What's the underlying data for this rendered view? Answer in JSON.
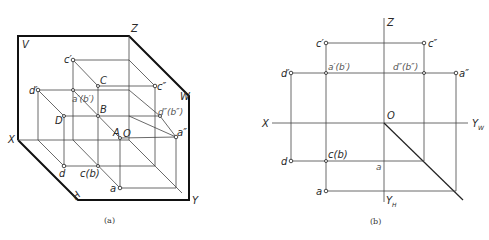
{
  "figure_a": {
    "caption": "(a)",
    "plane_labels": {
      "V": "V",
      "W": "W",
      "H": "H"
    },
    "axis_labels": {
      "X": "X",
      "Y": "Y",
      "Z": "Z",
      "O": "O"
    },
    "space_points": {
      "A": "A",
      "B": "B",
      "C": "C",
      "D": "D"
    },
    "projection_labels": {
      "c_prime": "c′",
      "c_dprime": "c″",
      "d_prime": "d′",
      "a_prime_b_prime": "a′(b′)",
      "d_dprime_b_dprime": "d″(b″)",
      "a_dprime": "a″",
      "d": "d",
      "c_b": "c(b)",
      "a": "a"
    }
  },
  "figure_b": {
    "caption": "(b)",
    "axis_labels": {
      "X": "X",
      "Z": "Z",
      "O": "O",
      "Yw": "Y",
      "Yw_sub": "W",
      "Yh": "Y",
      "Yh_sub": "H"
    },
    "projection_labels": {
      "c_prime": "c′",
      "c_dprime": "c″",
      "d_prime": "d′",
      "a_prime_b_prime": "a′(b′)",
      "d_dprime_b_dprime": "d″(b″)",
      "a_dprime": "a″",
      "d": "d",
      "c_b": "c(b)",
      "a_mid": "a",
      "a": "a"
    }
  }
}
